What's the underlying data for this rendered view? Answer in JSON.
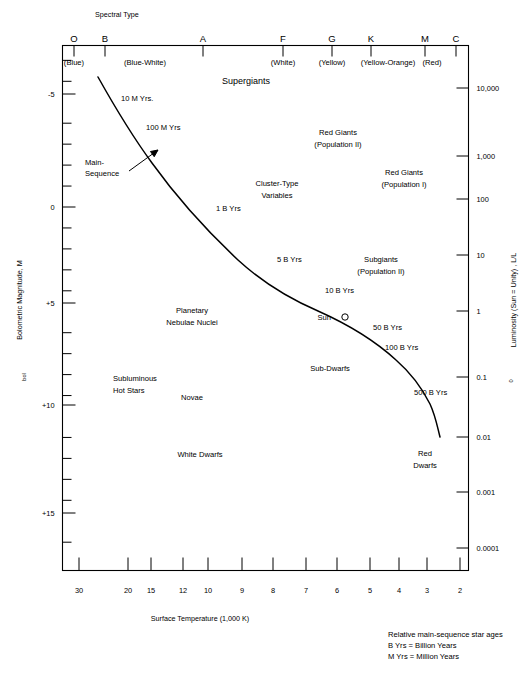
{
  "figure": {
    "top_axis_title": "Spectral Type",
    "left_axis_title": "Bolometric Magnitude,  M",
    "left_axis_title_sub": "bol",
    "right_axis_title": "Luminosity (Sun = Unity) , L/L",
    "right_axis_title_sub": "0",
    "bottom_axis_title": "Surface Temperature  (1,000 K)"
  },
  "notes": [
    "Relative main-sequence star ages",
    "B Yrs = Billion Years",
    "M Yrs = Million Years"
  ],
  "chart_data": {
    "type": "line",
    "xlabel": "Surface Temperature  (1,000 K)",
    "ylabel": "Bolometric Magnitude,  M bol",
    "y2label": "Luminosity (Sun = Unity) , L/L 0",
    "grid": false,
    "legend": "none",
    "xlim": [
      30,
      2
    ],
    "ylim": [
      -7.5,
      16.5
    ],
    "spectral_classes": [
      {
        "label": "O",
        "color_name": "(Blue)",
        "x": 74
      },
      {
        "label": "B",
        "color_name": "(Blue-White)",
        "x": 105
      },
      {
        "label": "A",
        "color_name": "(White)",
        "x": 203
      },
      {
        "label": "F",
        "color_name": "",
        "x": 283
      },
      {
        "label": "G",
        "color_name": "(Yellow)",
        "x": 332
      },
      {
        "label": "K",
        "color_name": "(Yellow-Orange)",
        "x": 371
      },
      {
        "label": "M",
        "color_name": "(Red)",
        "x": 425
      },
      {
        "label": "C",
        "color_name": "",
        "x": 456
      }
    ],
    "spectral_color_labels": [
      {
        "text": "(Blue)",
        "x": 74
      },
      {
        "text": "(Blue-White)",
        "x": 145
      },
      {
        "text": "(White)",
        "x": 283
      },
      {
        "text": "(Yellow)",
        "x": 332
      },
      {
        "text": "(Yellow-Orange)",
        "x": 388
      },
      {
        "text": "(Red)",
        "x": 432
      }
    ],
    "magnitude_ticks": [
      {
        "label": "-5",
        "value": -5,
        "y": 94
      },
      {
        "label": "0",
        "value": 0,
        "y": 207
      },
      {
        "label": "+5",
        "value": 5,
        "y": 303
      },
      {
        "label": "+10",
        "value": 10,
        "y": 405
      },
      {
        "label": "+15",
        "value": 15,
        "y": 513
      }
    ],
    "luminosity_ticks": [
      {
        "label": "10,000",
        "value": 10000,
        "y": 88
      },
      {
        "label": "1,000",
        "value": 1000,
        "y": 156
      },
      {
        "label": "100",
        "value": 100,
        "y": 199
      },
      {
        "label": "10",
        "value": 10,
        "y": 255
      },
      {
        "label": "1",
        "value": 1,
        "y": 311
      },
      {
        "label": "0.1",
        "value": 0.1,
        "y": 377
      },
      {
        "label": "0.01",
        "value": 0.01,
        "y": 437
      },
      {
        "label": "0.001",
        "value": 0.001,
        "y": 492
      },
      {
        "label": "0.0001",
        "value": 0.0001,
        "y": 548
      }
    ],
    "temperature_ticks": [
      {
        "label": "30",
        "value": 30,
        "x": 79
      },
      {
        "label": "20",
        "value": 20,
        "x": 128
      },
      {
        "label": "15",
        "value": 15,
        "x": 151
      },
      {
        "label": "12",
        "value": 12,
        "x": 183
      },
      {
        "label": "10",
        "value": 10,
        "x": 208
      },
      {
        "label": "9",
        "value": 9,
        "x": 242
      },
      {
        "label": "8",
        "value": 8,
        "x": 273
      },
      {
        "label": "7",
        "value": 7,
        "x": 306
      },
      {
        "label": "6",
        "value": 6,
        "x": 337
      },
      {
        "label": "5",
        "value": 5,
        "x": 370
      },
      {
        "label": "4",
        "value": 4,
        "x": 399
      },
      {
        "label": "3",
        "value": 3,
        "x": 427
      },
      {
        "label": "2",
        "value": 2,
        "x": 460
      }
    ],
    "main_sequence_curve": "M 98,77 C 112,102 130,133 152,163 C 175,195 205,229 238,260 C 262,282 290,299 318,311 C 345,323 372,338 396,360 C 412,374 423,390 430,404 C 436,417 438,430 440,437",
    "age_labels": [
      {
        "text": "10 M Yrs.",
        "x": 121,
        "y": 101
      },
      {
        "text": "100 M Yrs",
        "x": 146,
        "y": 130
      },
      {
        "text": "1 B Yrs",
        "x": 216,
        "y": 211
      },
      {
        "text": "5 B Yrs",
        "x": 277,
        "y": 262
      },
      {
        "text": "10 B Yrs",
        "x": 325,
        "y": 293
      },
      {
        "text": "50 B Yrs",
        "x": 373,
        "y": 330
      },
      {
        "text": "100 B Yrs",
        "x": 385,
        "y": 350
      },
      {
        "text": "500 B Yrs",
        "x": 414,
        "y": 395
      }
    ],
    "region_labels": [
      {
        "text": "Supergiants",
        "x": 246,
        "y": 84,
        "size": "big",
        "anchor": "middle"
      },
      {
        "text": "Main-",
        "x": 85,
        "y": 165,
        "size": "small",
        "anchor": "start"
      },
      {
        "text": "Sequence",
        "x": 85,
        "y": 176,
        "size": "small",
        "anchor": "start"
      },
      {
        "text": "Red Giants",
        "x": 338,
        "y": 135,
        "size": "small",
        "anchor": "middle"
      },
      {
        "text": "(Population II)",
        "x": 338,
        "y": 147,
        "size": "small",
        "anchor": "middle"
      },
      {
        "text": "Red Giants",
        "x": 404,
        "y": 175,
        "size": "small",
        "anchor": "middle"
      },
      {
        "text": "(Population I)",
        "x": 404,
        "y": 187,
        "size": "small",
        "anchor": "middle"
      },
      {
        "text": "Cluster-Type",
        "x": 277,
        "y": 186,
        "size": "small",
        "anchor": "middle"
      },
      {
        "text": "Variables",
        "x": 277,
        "y": 198,
        "size": "small",
        "anchor": "middle"
      },
      {
        "text": "Subgiants",
        "x": 381,
        "y": 262,
        "size": "small",
        "anchor": "middle"
      },
      {
        "text": "(Population II)",
        "x": 381,
        "y": 274,
        "size": "small",
        "anchor": "middle"
      },
      {
        "text": "Sun",
        "x": 331,
        "y": 320,
        "size": "small",
        "anchor": "end"
      },
      {
        "text": "Planetary",
        "x": 192,
        "y": 313,
        "size": "small",
        "anchor": "middle"
      },
      {
        "text": "Nebulae Nuclei",
        "x": 192,
        "y": 325,
        "size": "small",
        "anchor": "middle"
      },
      {
        "text": "Sub-Dwarfs",
        "x": 330,
        "y": 371,
        "size": "small",
        "anchor": "middle"
      },
      {
        "text": "Subluminous",
        "x": 113,
        "y": 381,
        "size": "small",
        "anchor": "start"
      },
      {
        "text": "Hot Stars",
        "x": 113,
        "y": 393,
        "size": "small",
        "anchor": "start"
      },
      {
        "text": "Novae",
        "x": 192,
        "y": 400,
        "size": "small",
        "anchor": "middle"
      },
      {
        "text": "White Dwarfs",
        "x": 200,
        "y": 457,
        "size": "small",
        "anchor": "middle"
      },
      {
        "text": "Red",
        "x": 425,
        "y": 456,
        "size": "small",
        "anchor": "middle"
      },
      {
        "text": "Dwarfs",
        "x": 425,
        "y": 468,
        "size": "small",
        "anchor": "middle"
      }
    ],
    "sun_marker": {
      "x": 345,
      "y": 317,
      "r": 3.2,
      "label": "Sun"
    },
    "main_sequence_arrow": {
      "x1": 129,
      "y1": 171,
      "x2": 158,
      "y2": 150
    }
  }
}
